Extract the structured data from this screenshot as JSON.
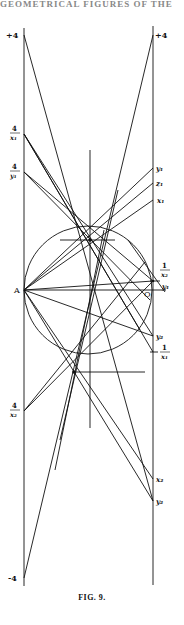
{
  "header": {
    "text": "GEOMETRICAL FIGURES OF THE"
  },
  "caption": {
    "text": "FIG. 9."
  },
  "labels": {
    "left_top": "+4",
    "right_top": "+4",
    "left_bottom": "-4",
    "four_over_x1_num": "4",
    "four_over_x1_den": "x₁",
    "four_over_y1_num": "4",
    "four_over_y1_den": "y₁",
    "A": "A",
    "four_over_x2_num": "4",
    "four_over_x2_den": "x₂",
    "y1": "y₁",
    "z1": "z₁",
    "x1": "x₁",
    "one_over_x2_num": "1",
    "one_over_x2_den": "x₂",
    "y1_small": "y₁",
    "O": "O",
    "y2_upper": "y₂",
    "neg_one_over_x1_num": "1",
    "neg_one_over_x1_den": "x₁",
    "x2": "x₂",
    "y2": "y₂"
  },
  "colors": {
    "ink": "#111111",
    "paper": "#ffffff"
  }
}
